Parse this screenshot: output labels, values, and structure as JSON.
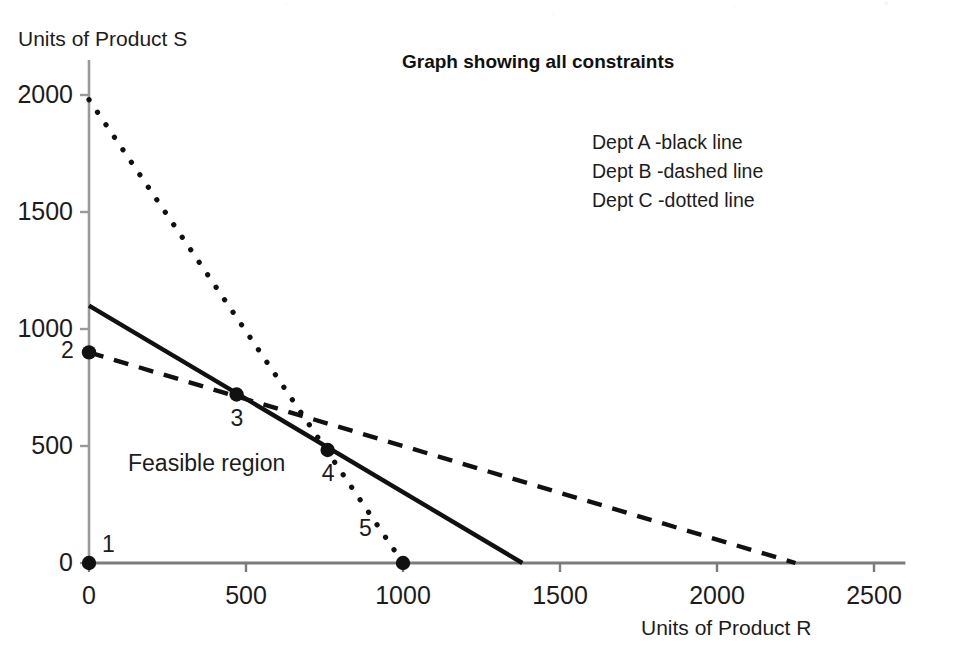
{
  "chart_data": {
    "type": "line",
    "title": "Graph showing all constraints",
    "xlabel": "Units of Product R",
    "ylabel": "Units of Product S",
    "xlim": [
      0,
      2600
    ],
    "ylim": [
      0,
      2150
    ],
    "grid": false,
    "legend_position": "top-right-inside",
    "xticks": [
      "0",
      "500",
      "1000",
      "1500",
      "2000",
      "2500"
    ],
    "xtick_values": [
      0,
      500,
      1000,
      1500,
      2000,
      2500
    ],
    "yticks": [
      "0",
      "500",
      "1000",
      "1500",
      "2000"
    ],
    "ytick_values": [
      0,
      500,
      1000,
      1500,
      2000
    ],
    "series": [
      {
        "name": "Dept A -black line",
        "style": "solid",
        "color": "#111111",
        "x": [
          0,
          1380
        ],
        "y": [
          1100,
          0
        ]
      },
      {
        "name": "Dept B -dashed line",
        "style": "dashed",
        "color": "#111111",
        "x": [
          0,
          2250
        ],
        "y": [
          900,
          0
        ]
      },
      {
        "name": "Dept C -dotted line",
        "style": "dotted",
        "color": "#111111",
        "x": [
          0,
          1000
        ],
        "y": [
          1980,
          0
        ]
      }
    ],
    "annotations": [
      {
        "text": "Feasible region",
        "x": 250,
        "y": 360
      }
    ],
    "vertices": [
      {
        "label": "1",
        "x": 0,
        "y": 0
      },
      {
        "label": "2",
        "x": 0,
        "y": 900
      },
      {
        "label": "3",
        "x": 470,
        "y": 720
      },
      {
        "label": "4",
        "x": 760,
        "y": 483
      },
      {
        "label": "5",
        "x": 1000,
        "y": 0
      }
    ]
  },
  "legend": {
    "entries": [
      "Dept A -black line",
      "Dept B -dashed line",
      "Dept C -dotted line"
    ]
  },
  "axes": {
    "y_title": "Units of Product S",
    "x_title": "Units of Product R"
  },
  "title": "Graph showing all constraints",
  "region": {
    "label": "Feasible region"
  }
}
